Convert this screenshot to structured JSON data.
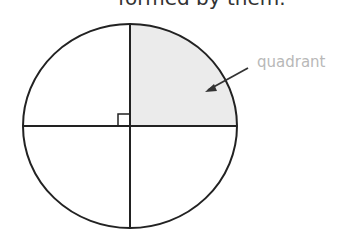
{
  "caption_cutoff": "formed by them.",
  "diagram": {
    "shape": "circle",
    "divided_into": 4,
    "highlighted_quadrant": "top-right",
    "label": "quadrant",
    "right_angle_marker": true,
    "colors": {
      "stroke": "#222222",
      "fill_highlight": "#ebebeb",
      "label": "#b8b8b8"
    }
  }
}
